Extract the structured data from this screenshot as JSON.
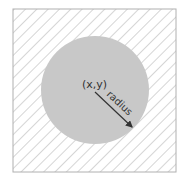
{
  "diagram": {
    "center_label": "(x,y)",
    "radius_label": "radius",
    "colors": {
      "circle_fill": "#c8c8c8",
      "hatch": "#b8b8b8",
      "border": "#b0b0b0",
      "text": "#333333",
      "arrow": "#333333"
    }
  }
}
